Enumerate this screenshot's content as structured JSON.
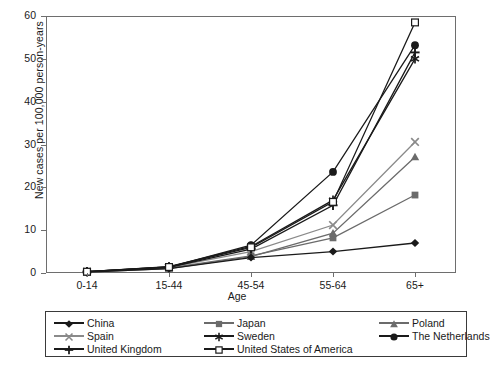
{
  "chart_data": {
    "type": "line",
    "title": "",
    "xlabel": "Age",
    "ylabel": "New cases per 100,000 person-years",
    "categories": [
      "0-14",
      "15-44",
      "45-54",
      "55-64",
      "65+"
    ],
    "ylim": [
      0,
      60
    ],
    "yticks": [
      0,
      10,
      20,
      30,
      40,
      50,
      60
    ],
    "grid": false,
    "legend_position": "below-plot",
    "series": [
      {
        "name": "China",
        "marker": "filled-diamond",
        "color": "#1a1a1a",
        "values": [
          0.2,
          1.0,
          3.6,
          5.0,
          7.0
        ]
      },
      {
        "name": "Japan",
        "marker": "filled-square",
        "color": "#6b6b6b",
        "values": [
          0.2,
          1.2,
          4.0,
          8.2,
          18.2
        ]
      },
      {
        "name": "Poland",
        "marker": "filled-triangle",
        "color": "#6b6b6b",
        "values": [
          0.2,
          1.0,
          3.8,
          9.3,
          27.1
        ]
      },
      {
        "name": "Spain",
        "marker": "x-cross",
        "color": "#8a8a8a",
        "values": [
          0.3,
          1.3,
          5.0,
          11.2,
          30.6
        ]
      },
      {
        "name": "Sweden",
        "marker": "asterisk",
        "color": "#1a1a1a",
        "values": [
          0.3,
          1.5,
          6.2,
          17.0,
          50.0
        ]
      },
      {
        "name": "The Netherlands",
        "marker": "filled-circle",
        "color": "#1a1a1a",
        "values": [
          0.3,
          1.4,
          6.5,
          23.6,
          53.2
        ]
      },
      {
        "name": "United Kingdom",
        "marker": "plus",
        "color": "#1a1a1a",
        "values": [
          0.3,
          1.3,
          5.6,
          15.8,
          51.5
        ]
      },
      {
        "name": "United States of America",
        "marker": "open-square",
        "color": "#1a1a1a",
        "values": [
          0.3,
          1.4,
          6.0,
          16.6,
          58.5
        ]
      }
    ]
  },
  "legend": {
    "order": [
      "China",
      "Japan",
      "Poland",
      "Spain",
      "Sweden",
      "The Netherlands",
      "United Kingdom",
      "United States of America"
    ]
  }
}
